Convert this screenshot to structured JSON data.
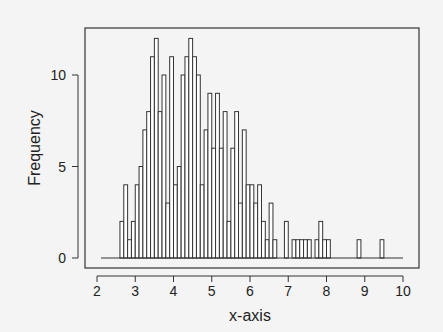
{
  "chart_data": {
    "type": "bar",
    "subtype": "histogram",
    "title": "",
    "xlabel": "x-axis",
    "ylabel": "Frequency",
    "xlim": [
      2,
      10
    ],
    "ylim": [
      0,
      12
    ],
    "bin_width": 0.1,
    "x_ticks": [
      "2",
      "3",
      "4",
      "5",
      "6",
      "7",
      "8",
      "9",
      "10"
    ],
    "y_ticks": [
      "0",
      "5",
      "10"
    ],
    "grid": false,
    "legend": null,
    "bins": [
      {
        "x": 2.6,
        "count": 2
      },
      {
        "x": 2.7,
        "count": 4
      },
      {
        "x": 2.8,
        "count": 1
      },
      {
        "x": 2.9,
        "count": 2
      },
      {
        "x": 3.0,
        "count": 4
      },
      {
        "x": 3.1,
        "count": 5
      },
      {
        "x": 3.2,
        "count": 7
      },
      {
        "x": 3.3,
        "count": 8
      },
      {
        "x": 3.4,
        "count": 11
      },
      {
        "x": 3.5,
        "count": 12
      },
      {
        "x": 3.6,
        "count": 8
      },
      {
        "x": 3.7,
        "count": 10
      },
      {
        "x": 3.8,
        "count": 3
      },
      {
        "x": 3.9,
        "count": 11
      },
      {
        "x": 4.0,
        "count": 4
      },
      {
        "x": 4.1,
        "count": 5
      },
      {
        "x": 4.2,
        "count": 10
      },
      {
        "x": 4.3,
        "count": 11
      },
      {
        "x": 4.4,
        "count": 12
      },
      {
        "x": 4.5,
        "count": 11
      },
      {
        "x": 4.6,
        "count": 10
      },
      {
        "x": 4.7,
        "count": 4
      },
      {
        "x": 4.8,
        "count": 7
      },
      {
        "x": 4.9,
        "count": 9
      },
      {
        "x": 5.0,
        "count": 6
      },
      {
        "x": 5.1,
        "count": 9
      },
      {
        "x": 5.2,
        "count": 6
      },
      {
        "x": 5.3,
        "count": 8
      },
      {
        "x": 5.4,
        "count": 2
      },
      {
        "x": 5.5,
        "count": 6
      },
      {
        "x": 5.6,
        "count": 8
      },
      {
        "x": 5.7,
        "count": 3
      },
      {
        "x": 5.8,
        "count": 7
      },
      {
        "x": 5.9,
        "count": 4
      },
      {
        "x": 6.0,
        "count": 4
      },
      {
        "x": 6.1,
        "count": 3
      },
      {
        "x": 6.2,
        "count": 4
      },
      {
        "x": 6.3,
        "count": 2
      },
      {
        "x": 6.4,
        "count": 1
      },
      {
        "x": 6.5,
        "count": 3
      },
      {
        "x": 6.6,
        "count": 1
      },
      {
        "x": 6.9,
        "count": 2
      },
      {
        "x": 7.1,
        "count": 1
      },
      {
        "x": 7.2,
        "count": 1
      },
      {
        "x": 7.3,
        "count": 1
      },
      {
        "x": 7.4,
        "count": 1
      },
      {
        "x": 7.5,
        "count": 1
      },
      {
        "x": 7.7,
        "count": 1
      },
      {
        "x": 7.8,
        "count": 2
      },
      {
        "x": 7.9,
        "count": 1
      },
      {
        "x": 8.0,
        "count": 1
      },
      {
        "x": 8.8,
        "count": 1
      },
      {
        "x": 9.4,
        "count": 1
      }
    ]
  },
  "colors": {
    "background": "#f4f4f4",
    "bar_fill": "#ffffff",
    "stroke": "#333333"
  }
}
